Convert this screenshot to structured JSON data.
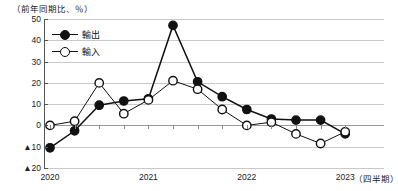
{
  "chart_data": {
    "type": "line",
    "title": "",
    "unit_note": "（前年同期比、％）",
    "xlabel": "（四半期）",
    "ylabel": "",
    "ylim": [
      -20,
      50
    ],
    "yticks": [
      50,
      40,
      30,
      20,
      10,
      0,
      -10,
      -20
    ],
    "ytick_labels": [
      "50",
      "40",
      "30",
      "20",
      "10",
      "0",
      "▲10",
      "▲20"
    ],
    "grid": true,
    "legend_position": "top-left",
    "x_group_labels": [
      "2020",
      "2021",
      "2022",
      "2023"
    ],
    "x": [
      "2020Q1",
      "2020Q2",
      "2020Q3",
      "2020Q4",
      "2021Q1",
      "2021Q2",
      "2021Q3",
      "2021Q4",
      "2022Q1",
      "2022Q2",
      "2022Q3",
      "2022Q4",
      "2023Q1"
    ],
    "series": [
      {
        "name": "輸出",
        "marker": "filled-circle",
        "color": "#111111",
        "values": [
          -10.5,
          -2.5,
          9.5,
          11.5,
          12.5,
          47.0,
          20.5,
          13.5,
          7.5,
          3.0,
          2.5,
          2.5,
          -4.0
        ]
      },
      {
        "name": "輸入",
        "marker": "open-circle",
        "color": "#111111",
        "values": [
          0.0,
          2.0,
          20.0,
          5.5,
          12.0,
          21.0,
          17.0,
          7.5,
          0.0,
          1.5,
          -4.0,
          -8.5,
          -3.0
        ]
      }
    ]
  },
  "legend": {
    "items": [
      {
        "label": "輸出",
        "marker": "filled-circle"
      },
      {
        "label": "輸入",
        "marker": "open-circle"
      }
    ]
  },
  "axes": {
    "unit_label": "（前年同期比、％）",
    "x_unit_label": "（四半期）",
    "x_labels": [
      "2020",
      "2021",
      "2022",
      "2023"
    ],
    "y_labels": [
      "50",
      "40",
      "30",
      "20",
      "10",
      "0",
      "▲10",
      "▲20"
    ]
  }
}
